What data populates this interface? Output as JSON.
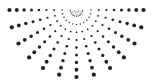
{
  "graphic": {
    "name": "radial-halftone-sunburst",
    "center": [
      76.5,
      10
    ],
    "ray_count": 13,
    "start_angle_deg": 0,
    "end_angle_deg": 180,
    "inner_radius": 6,
    "outer_radius": 67,
    "dots_per_ray": 9,
    "min_dot_radius": 0.5,
    "max_dot_radius": 2.1,
    "dot_color": "#222222",
    "background": "#ffffff"
  }
}
